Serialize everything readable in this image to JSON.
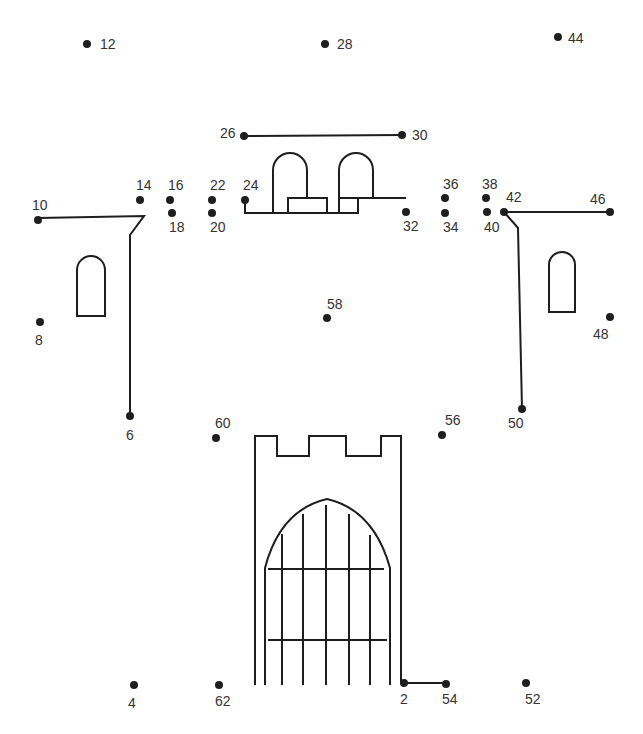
{
  "puzzle": {
    "type": "connect-the-dots",
    "subject": "castle",
    "ink_color": "#1e1e1e",
    "points": [
      {
        "n": "2",
        "x": 404,
        "y": 683,
        "lx": 400,
        "ly": 692
      },
      {
        "n": "4",
        "x": 134,
        "y": 685,
        "lx": 128,
        "ly": 696
      },
      {
        "n": "6",
        "x": 130,
        "y": 416,
        "lx": 126,
        "ly": 428
      },
      {
        "n": "8",
        "x": 40,
        "y": 322,
        "lx": 35,
        "ly": 333
      },
      {
        "n": "10",
        "x": 38,
        "y": 220,
        "lx": 32,
        "ly": 198
      },
      {
        "n": "12",
        "x": 87,
        "y": 44,
        "lx": 100,
        "ly": 37
      },
      {
        "n": "14",
        "x": 140,
        "y": 200,
        "lx": 136,
        "ly": 178
      },
      {
        "n": "16",
        "x": 170,
        "y": 200,
        "lx": 168,
        "ly": 178
      },
      {
        "n": "18",
        "x": 172,
        "y": 213,
        "lx": 169,
        "ly": 220
      },
      {
        "n": "20",
        "x": 212,
        "y": 213,
        "lx": 210,
        "ly": 220
      },
      {
        "n": "22",
        "x": 212,
        "y": 200,
        "lx": 210,
        "ly": 178
      },
      {
        "n": "24",
        "x": 245,
        "y": 200,
        "lx": 243,
        "ly": 178
      },
      {
        "n": "26",
        "x": 244,
        "y": 136,
        "lx": 220,
        "ly": 126
      },
      {
        "n": "28",
        "x": 325,
        "y": 44,
        "lx": 337,
        "ly": 37
      },
      {
        "n": "30",
        "x": 402,
        "y": 135,
        "lx": 412,
        "ly": 128
      },
      {
        "n": "32",
        "x": 406,
        "y": 212,
        "lx": 403,
        "ly": 219
      },
      {
        "n": "34",
        "x": 445,
        "y": 213,
        "lx": 443,
        "ly": 220
      },
      {
        "n": "36",
        "x": 445,
        "y": 198,
        "lx": 443,
        "ly": 177
      },
      {
        "n": "38",
        "x": 486,
        "y": 198,
        "lx": 482,
        "ly": 177
      },
      {
        "n": "40",
        "x": 487,
        "y": 212,
        "lx": 484,
        "ly": 220
      },
      {
        "n": "42",
        "x": 504,
        "y": 212,
        "lx": 506,
        "ly": 190
      },
      {
        "n": "44",
        "x": 558,
        "y": 37,
        "lx": 568,
        "ly": 31
      },
      {
        "n": "46",
        "x": 610,
        "y": 212,
        "lx": 590,
        "ly": 192
      },
      {
        "n": "48",
        "x": 610,
        "y": 317,
        "lx": 593,
        "ly": 327
      },
      {
        "n": "50",
        "x": 522,
        "y": 409,
        "lx": 508,
        "ly": 416
      },
      {
        "n": "52",
        "x": 526,
        "y": 683,
        "lx": 525,
        "ly": 692
      },
      {
        "n": "54",
        "x": 446,
        "y": 684,
        "lx": 442,
        "ly": 692
      },
      {
        "n": "56",
        "x": 442,
        "y": 435,
        "lx": 445,
        "ly": 413
      },
      {
        "n": "58",
        "x": 327,
        "y": 318,
        "lx": 327,
        "ly": 297
      },
      {
        "n": "60",
        "x": 216,
        "y": 438,
        "lx": 215,
        "ly": 416
      },
      {
        "n": "62",
        "x": 219,
        "y": 685,
        "lx": 215,
        "ly": 694
      }
    ]
  }
}
